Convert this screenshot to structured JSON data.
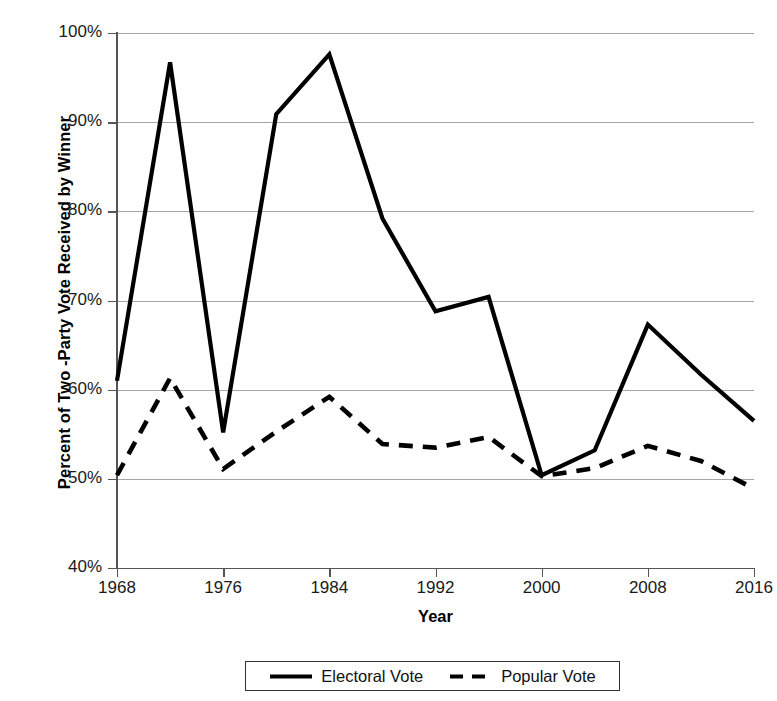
{
  "chart_data": {
    "type": "line",
    "title": "",
    "xlabel": "Year",
    "ylabel": "Percent of Two -Party Vote Received by Winner",
    "x": [
      1968,
      1972,
      1976,
      1980,
      1984,
      1988,
      1992,
      1996,
      2000,
      2004,
      2008,
      2012,
      2016
    ],
    "categories": [
      "1968",
      "1972",
      "1976",
      "1980",
      "1984",
      "1988",
      "1992",
      "1996",
      "2000",
      "2004",
      "2008",
      "2012",
      "2016"
    ],
    "xlim": [
      1968,
      2016
    ],
    "ylim": [
      40,
      100
    ],
    "y_tick_labels": [
      "100%",
      "90%",
      "80%",
      "70%",
      "60%",
      "50%",
      "40%"
    ],
    "y_tick_values": [
      100,
      90,
      80,
      70,
      60,
      50,
      40
    ],
    "x_tick_labels": [
      "1968",
      "1976",
      "1984",
      "1992",
      "2000",
      "2008",
      "2016"
    ],
    "x_tick_values": [
      1968,
      1976,
      1984,
      1992,
      2000,
      2008,
      2016
    ],
    "grid": true,
    "legend_position": "bottom",
    "series": [
      {
        "name": "Electoral Vote",
        "style": "solid",
        "color": "#000000",
        "values": [
          61.0,
          96.7,
          55.2,
          90.9,
          97.6,
          79.2,
          68.8,
          70.4,
          50.4,
          53.2,
          67.3,
          61.7,
          56.5
        ]
      },
      {
        "name": "Popular Vote",
        "style": "dashed",
        "color": "#000000",
        "values": [
          50.4,
          61.3,
          51.1,
          55.3,
          59.2,
          53.9,
          53.5,
          54.7,
          50.3,
          51.2,
          53.7,
          52.0,
          48.9
        ]
      }
    ]
  },
  "legend": {
    "entries": [
      {
        "label": "Electoral Vote",
        "style": "solid"
      },
      {
        "label": "Popular Vote",
        "style": "dashed"
      }
    ]
  }
}
